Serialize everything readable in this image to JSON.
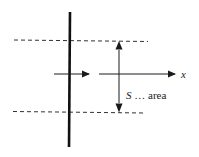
{
  "diagram": {
    "labels": {
      "axis": "x",
      "area_symbol": "S",
      "area_text": " … area"
    },
    "colors": {
      "stroke": "#1a1a1a",
      "background": "#ffffff"
    },
    "elements": {
      "wall": "thick vertical line (plane/wall)",
      "top_boundary": "dashed horizontal line",
      "bottom_boundary": "dashed horizontal line",
      "flow_arrow": "short horizontal arrow crossing the wall",
      "x_axis": "horizontal arrow labeled x",
      "area_extent": "double-headed vertical arrow spanning the area S"
    }
  }
}
